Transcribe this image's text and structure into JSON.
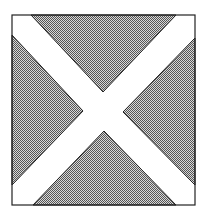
{
  "figure": {
    "colors": {
      "background": "#ffffff",
      "border": "#222222",
      "stipple_dark": "#555555",
      "stipple_light": "#d8d8d8",
      "cross": "#ffffff"
    },
    "frame": {
      "x": 12,
      "y": 15,
      "width": 183,
      "height": 190
    },
    "triangles": [
      {
        "name": "top",
        "points": "31,15 176,15 103,92"
      },
      {
        "name": "left",
        "points": "12,35 12,185 83,111"
      },
      {
        "name": "right",
        "points": "195,38 195,185 123,112"
      },
      {
        "name": "bottom",
        "points": "33,205 176,205 104,131"
      }
    ]
  }
}
